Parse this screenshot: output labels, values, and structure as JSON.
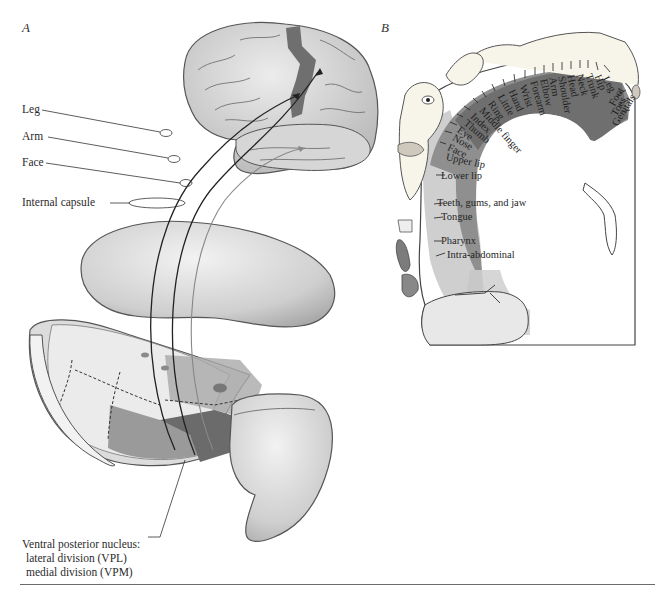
{
  "panels": {
    "a": {
      "letter": "A",
      "labels": {
        "leg": "Leg",
        "arm": "Arm",
        "face": "Face",
        "internal_capsule": "Internal capsule"
      },
      "nucleus": {
        "title": "Ventral posterior nucleus:",
        "lateral": "lateral division (VPL)",
        "medial": "medial division (VPM)"
      }
    },
    "b": {
      "letter": "B",
      "homunculus_labels": [
        "Leg",
        "Hip",
        "Trunk",
        "Neck",
        "Head",
        "Shoulder",
        "Arm",
        "Elbow",
        "Forearm",
        "Wrist",
        "Hand",
        "Little",
        "Ring",
        "Middle finger",
        "Index",
        "Thumb",
        "Eye",
        "Nose",
        "Face",
        "Upper lip",
        "Foot",
        "Toes",
        "Genitals"
      ],
      "lower_labels": [
        "Lower lip",
        "Teeth, gums, and jaw",
        "Tongue",
        "Pharynx",
        "Intra-abdominal"
      ]
    }
  },
  "colors": {
    "cortex_dark": "#6f6f6f",
    "cortex_mid": "#8d8d8d",
    "cortex_light": "#b5b5b5",
    "white_matter": "#d9d9d9",
    "brain_surface": "#d3d3d3",
    "outline": "#444444"
  }
}
